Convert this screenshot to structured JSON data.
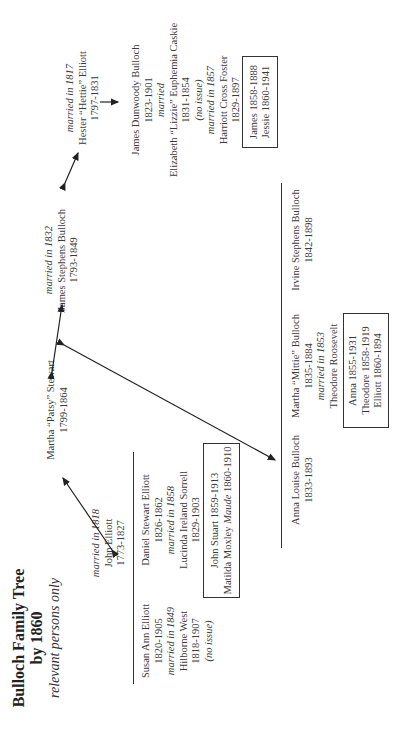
{
  "title": {
    "line1": "Bulloch Family Tree",
    "line2": "by 1860",
    "subtitle": "relevant persons only"
  },
  "people": {
    "john_elliott": {
      "married": "married in 1818",
      "name": "John Elliott",
      "dates": "1773-1827"
    },
    "martha_patsy": {
      "name": "Martha “Patsy” Stewart",
      "dates": "1799-1864"
    },
    "james_stephens": {
      "married": "married in 1832",
      "name": "James Stephens Bulloch",
      "dates": "1793-1849"
    },
    "hester": {
      "married": "married in 1817",
      "name": "Hester “Hettie” Elliott",
      "dates": "1797-1831"
    },
    "james_dunwoody": {
      "name": "James Dunwoody Bulloch",
      "dates": "1823-1901",
      "married1": "married",
      "spouse1": "Elizabeth “Lizzie” Euphemia Caskie",
      "spouse1_dates": "1831-1854",
      "spouse1_note": "(no issue)",
      "married2": "married in 1857",
      "spouse2": "Harriott Cross Foster",
      "spouse2_dates": "1829-1897"
    },
    "susan_ann": {
      "name": "Susan Ann Elliott",
      "dates": "1820-1905",
      "married": "married in 1849",
      "spouse": "Hilborne West",
      "spouse_dates": "1818-1907",
      "note": "(no issue)"
    },
    "daniel_stewart": {
      "name": "Daniel Stewart Elliott",
      "dates": "1826-1862",
      "married": "married in 1858",
      "spouse": "Lucinda Ireland Sorrell",
      "spouse_dates": "1829-1903"
    },
    "anna_louise": {
      "name": "Anna Louise Bulloch",
      "dates": "1833-1893"
    },
    "martha_mittie": {
      "name": "Martha “Mittie” Bulloch",
      "dates": "1835-1884",
      "married": "married in 1853",
      "spouse": "Theodore Roosevelt"
    },
    "irvine": {
      "name": "Irvine Stephens Bulloch",
      "dates": "1842-1898"
    }
  },
  "children_boxes": {
    "james_dunwoody_children": [
      "James 1858-1888",
      "Jessie 1860-1941"
    ],
    "daniel_children": {
      "line1": "John Stuart 1859-1913",
      "line2_prefix": "Matilda Moxley ",
      "line2_nick": "Maude",
      "line2_dates": " 1860-1910"
    },
    "mittie_children": [
      "Anna 1855-1931",
      "Theodore 1858-1919",
      "Elliott 1860-1894"
    ]
  },
  "colors": {
    "text": "#3a3a3a",
    "line": "#333333",
    "background": "#ffffff"
  }
}
